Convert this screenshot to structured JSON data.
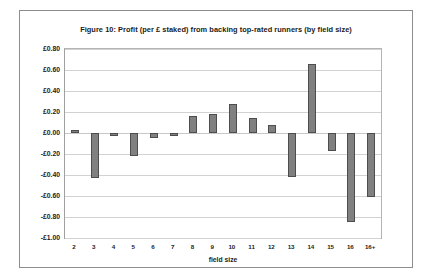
{
  "figure": {
    "title": "Figure 10: Profit (per £ staked) from backing top-rated runners (by field size)"
  },
  "chart_data": {
    "type": "bar",
    "title": "Figure 10: Profit (per £ staked) from backing top-rated runners (by field size)",
    "xlabel": "field size",
    "ylabel": "",
    "categories": [
      "2",
      "3",
      "4",
      "5",
      "6",
      "7",
      "8",
      "9",
      "10",
      "11",
      "12",
      "13",
      "14",
      "15",
      "16",
      "16+"
    ],
    "values": [
      0.03,
      -0.43,
      -0.03,
      -0.22,
      -0.05,
      -0.03,
      0.16,
      0.18,
      0.28,
      0.14,
      0.08,
      -0.42,
      0.66,
      -0.17,
      -0.85,
      -0.61
    ],
    "ylim": [
      -1.0,
      0.8
    ],
    "ytick_values": [
      0.8,
      0.6,
      0.4,
      0.2,
      0.0,
      -0.2,
      -0.4,
      -0.6,
      -0.8,
      -1.0
    ],
    "ytick_labels": [
      "£0.80",
      "£0.60",
      "£0.40",
      "£0.20",
      "£0.00",
      "-£0.20",
      "-£0.40",
      "-£0.60",
      "-£0.80",
      "-£1.00"
    ],
    "grid": true,
    "legend": false,
    "bar_color": "#808080",
    "bar_border_color": "#4d4d4d",
    "gridline_color": "#d2d2d2"
  }
}
